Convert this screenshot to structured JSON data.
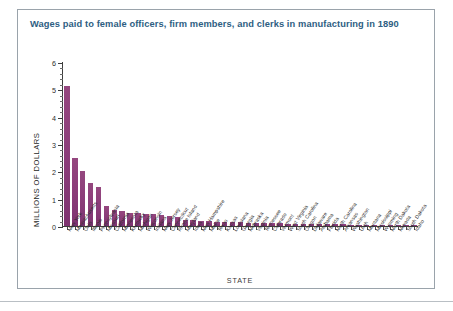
{
  "figure": {
    "title": "Wages paid to female officers, firm members, and clerks in manufacturing in 1890",
    "border_color": "#9aa3ab",
    "title_color": "#2e5e82",
    "bar_color": "#8d3f7e"
  },
  "axes": {
    "y_axis_title": "MILLIONS OF DOLLARS",
    "x_axis_title": "STATE",
    "y_tick_labels": [
      "0",
      "1",
      "2",
      "3",
      "4",
      "5",
      "6"
    ]
  },
  "chart_data": {
    "type": "bar",
    "title": "Wages paid to female officers, firm members, and clerks in manufacturing in 1890",
    "xlabel": "STATE",
    "ylabel": "MILLIONS OF DOLLARS",
    "ylim": [
      0,
      6
    ],
    "yticks": [
      0,
      1,
      2,
      3,
      4,
      5,
      6
    ],
    "grid": false,
    "legend": "none",
    "bar_color": "#8d3f7e",
    "categories": [
      "New York",
      "Massachusetts",
      "Ohio",
      "Illinois",
      "Pennsylvania",
      "Missouri",
      "California",
      "Minnesota",
      "Kentucky",
      "Michigan",
      "Wisconsin",
      "Indiana",
      "New Jersey",
      "Connecticut",
      "Rhode Island",
      "Maryland",
      "Iowa",
      "New Hampshire",
      "Maine",
      "Texas",
      "Kansas",
      "Louisiana",
      "Georgia",
      "Nebraska",
      "Virginia",
      "Tennessee",
      "Colorado",
      "Vermont",
      "West Virginia",
      "South Carolina",
      "Oregon",
      "Delaware",
      "Alabama",
      "Florida",
      "North Carolina",
      "Arkansas",
      "Washington",
      "Utah",
      "Montana",
      "Mississippi",
      "Wyoming",
      "North Dakota",
      "Nevada",
      "South Dakota",
      "Idaho"
    ],
    "values": [
      5.12,
      2.48,
      2.02,
      1.58,
      1.42,
      0.73,
      0.58,
      0.56,
      0.47,
      0.46,
      0.43,
      0.43,
      0.42,
      0.36,
      0.34,
      0.23,
      0.21,
      0.2,
      0.2,
      0.15,
      0.14,
      0.14,
      0.13,
      0.12,
      0.11,
      0.11,
      0.1,
      0.1,
      0.09,
      0.09,
      0.08,
      0.08,
      0.07,
      0.07,
      0.06,
      0.06,
      0.05,
      0.04,
      0.04,
      0.03,
      0.03,
      0.02,
      0.02,
      0.01,
      0.01
    ]
  }
}
